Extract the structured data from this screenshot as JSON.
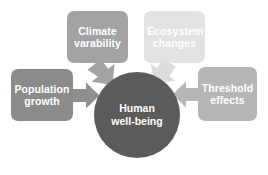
{
  "diagram": {
    "type": "converging-influences",
    "center": {
      "label": "Human\nwell-being",
      "shape": "circle",
      "color": "#5b5b5b",
      "text_color": "#ffffff"
    },
    "nodes": [
      {
        "id": "climate",
        "label": "Climate\nvarability",
        "position": "top-left",
        "color": "#a3a3a3",
        "text_color": "#ffffff"
      },
      {
        "id": "ecosystem",
        "label": "Ecosystem\nchanges",
        "position": "top-right",
        "color": "#e2e2e2",
        "text_color": "#ffffff"
      },
      {
        "id": "population",
        "label": "Population\ngrowth",
        "position": "left",
        "color": "#8b8b8b",
        "text_color": "#ffffff"
      },
      {
        "id": "threshold",
        "label": "Threshold\neffects",
        "position": "right",
        "color": "#b6b6b6",
        "text_color": "#ffffff"
      }
    ],
    "arrows": [
      {
        "id": "arrow-climate-to-center",
        "from": "climate",
        "to": "center",
        "direction": "down-right",
        "color": "#a3a3a3"
      },
      {
        "id": "arrow-ecosystem-to-center",
        "from": "ecosystem",
        "to": "center",
        "direction": "down-left",
        "color": "#dcdcdc"
      },
      {
        "id": "arrow-population-to-center",
        "from": "population",
        "to": "center",
        "direction": "right",
        "color": "#8f8f8f"
      },
      {
        "id": "arrow-threshold-to-center",
        "from": "threshold",
        "to": "center",
        "direction": "left",
        "color": "#b6b6b6"
      }
    ],
    "background_color": "#ffffff"
  }
}
